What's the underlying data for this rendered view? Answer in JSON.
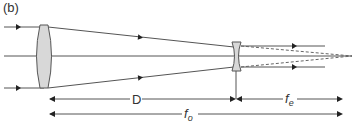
{
  "figure": {
    "panel_label": "(b)",
    "labels": {
      "distance_between_lenses": "D",
      "eyepiece_focal_length": "f",
      "eyepiece_focal_sub": "e",
      "objective_focal_length": "f",
      "objective_focal_sub": "o"
    },
    "elements": {
      "objective_lens": "converging (convex) lens",
      "eyepiece_lens": "diverging (concave) lens"
    },
    "colors": {
      "line": "#555555",
      "lens_fill": "#d8d8d8",
      "lens_stroke": "#555555",
      "text": "#333333"
    }
  }
}
